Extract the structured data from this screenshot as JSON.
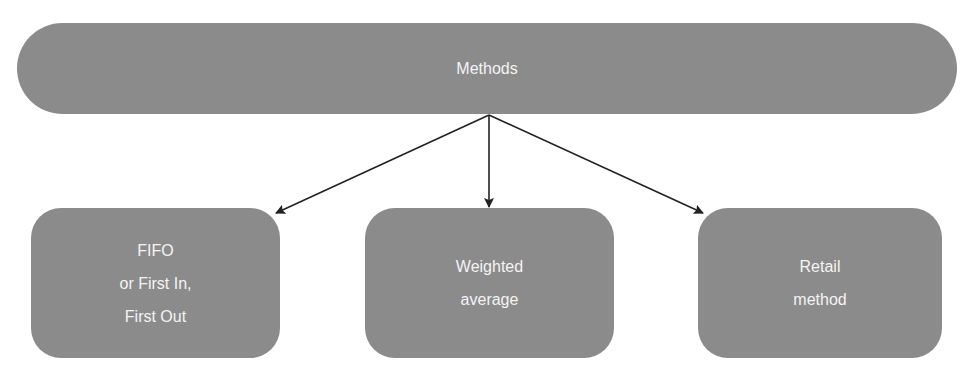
{
  "diagram": {
    "root": {
      "label": "Methods"
    },
    "children": [
      {
        "label": "FIFO\nor First In,\nFirst Out"
      },
      {
        "label": "Weighted\naverage"
      },
      {
        "label": "Retail\nmethod"
      }
    ],
    "colors": {
      "node_fill": "#8b8b8b",
      "node_text": "#f4f4f4",
      "arrow": "#222222"
    }
  }
}
